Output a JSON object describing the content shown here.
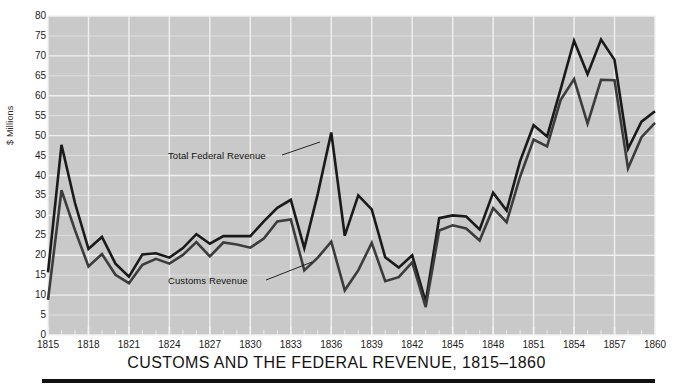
{
  "title": "CUSTOMS AND THE FEDERAL REVENUE, 1815–1860",
  "axes": {
    "ylabel": "$ Millions",
    "yticks": [
      "0",
      "5",
      "10",
      "15",
      "20",
      "25",
      "30",
      "35",
      "40",
      "45",
      "50",
      "55",
      "60",
      "65",
      "70",
      "75",
      "80"
    ],
    "xticks": [
      "1815",
      "1818",
      "1821",
      "1824",
      "1827",
      "1830",
      "1833",
      "1836",
      "1839",
      "1842",
      "1845",
      "1848",
      "1851",
      "1854",
      "1857",
      "1860"
    ]
  },
  "annotations": {
    "total": "Total Federal Revenue",
    "customs": "Customs Revenue"
  },
  "colors": {
    "plot_background": "#c9c9c9",
    "gridline": "#f2f2f2",
    "total_line": "#1a1a1a",
    "customs_line": "#3c3c3c",
    "page_background": "#ffffff",
    "text": "#141414",
    "rule": "#101010"
  },
  "chart_data": {
    "type": "line",
    "title": "CUSTOMS AND THE FEDERAL REVENUE, 1815–1860",
    "xlabel": "",
    "ylabel": "$ Millions",
    "xlim": [
      1815,
      1860
    ],
    "ylim": [
      0,
      80
    ],
    "grid": true,
    "legend": "annotated-inline",
    "x": [
      1815,
      1816,
      1817,
      1818,
      1819,
      1820,
      1821,
      1822,
      1823,
      1824,
      1825,
      1826,
      1827,
      1828,
      1829,
      1830,
      1831,
      1832,
      1833,
      1834,
      1835,
      1836,
      1837,
      1838,
      1839,
      1840,
      1841,
      1842,
      1843,
      1844,
      1845,
      1846,
      1847,
      1848,
      1849,
      1850,
      1851,
      1852,
      1853,
      1854,
      1855,
      1856,
      1857,
      1858,
      1859,
      1860
    ],
    "series": [
      {
        "name": "Total Federal Revenue",
        "color": "#1a1a1a",
        "values": [
          15.7,
          47.7,
          33.1,
          21.6,
          24.6,
          17.9,
          14.6,
          20.2,
          20.5,
          19.4,
          21.8,
          25.3,
          22.9,
          24.8,
          24.8,
          24.8,
          28.5,
          31.9,
          33.9,
          21.8,
          35.4,
          50.8,
          24.9,
          35.0,
          31.5,
          19.5,
          16.9,
          20.0,
          8.3,
          29.3,
          30.0,
          29.7,
          26.5,
          35.7,
          31.2,
          43.6,
          52.6,
          49.8,
          61.6,
          73.8,
          65.4,
          74.1,
          69.0,
          46.7,
          53.5,
          56.1
        ]
      },
      {
        "name": "Customs Revenue",
        "color": "#3c3c3c",
        "values": [
          8.8,
          36.3,
          26.3,
          17.2,
          20.3,
          15.1,
          13.0,
          17.6,
          19.1,
          17.9,
          20.1,
          23.3,
          19.7,
          23.2,
          22.7,
          21.9,
          24.2,
          28.5,
          29.0,
          16.2,
          19.4,
          23.4,
          11.2,
          16.2,
          23.1,
          13.5,
          14.5,
          18.2,
          7.0,
          26.2,
          27.5,
          26.7,
          23.7,
          31.8,
          28.3,
          39.7,
          49.0,
          47.3,
          58.9,
          64.2,
          53.0,
          64.0,
          63.9,
          41.8,
          49.6,
          53.2
        ]
      }
    ]
  }
}
